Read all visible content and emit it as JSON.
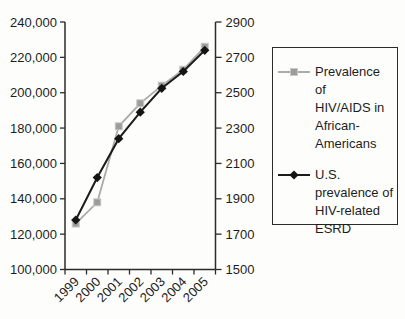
{
  "chart_data": {
    "type": "line",
    "title": "",
    "xlabel": "",
    "ylabel_left": "",
    "ylabel_right": "",
    "grid": false,
    "legend_position": "right",
    "categories": [
      "1999",
      "2000",
      "2001",
      "2002",
      "2003",
      "2004",
      "2005"
    ],
    "left_axis": {
      "min": 100000,
      "max": 240000,
      "step": 20000,
      "tick_labels": [
        "100,000",
        "120,000",
        "140,000",
        "160,000",
        "180,000",
        "200,000",
        "220,000",
        "240,000"
      ]
    },
    "right_axis": {
      "min": 1500,
      "max": 2900,
      "step": 200,
      "tick_labels": [
        "1500",
        "1700",
        "1900",
        "2100",
        "2300",
        "2500",
        "2700",
        "2900"
      ]
    },
    "series": [
      {
        "name": "Prevalence of HIV/AIDS in African-Americans",
        "axis": "left",
        "marker": "square",
        "line_color": "#ababab",
        "marker_color": "#9c9c9c",
        "values": [
          126000,
          138000,
          181000,
          194000,
          204000,
          213000,
          226000
        ]
      },
      {
        "name": "U.S. prevalence of HIV-related ESRD",
        "axis": "right",
        "marker": "diamond",
        "line_color": "#1c1c1c",
        "marker_color": "#141414",
        "values": [
          1780,
          2020,
          2240,
          2390,
          2525,
          2620,
          2740
        ]
      }
    ]
  },
  "legend": {
    "entries": [
      {
        "label": "Prevalence of\nHIV/AIDS in\nAfrican-\nAmericans"
      },
      {
        "label": "U.S.\nprevalence of\nHIV-related\nESRD"
      }
    ]
  },
  "colors": {
    "axis": "#2b2b2b",
    "text": "#1d1d1d",
    "background": "#fdfdfc"
  }
}
